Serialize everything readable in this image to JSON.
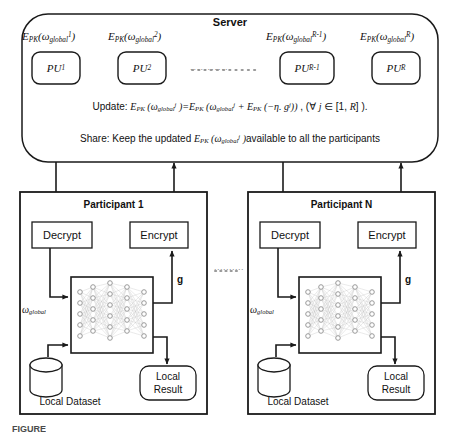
{
  "diagram": {
    "colors": {
      "stroke": "#1a1a1a",
      "background": "#ffffff",
      "network_node": "#9a9a9a",
      "network_edge": "#c8c8c8"
    }
  },
  "server": {
    "title": "Server",
    "pu_units": [
      {
        "id": "pu1",
        "label_base": "PU",
        "label_sub": "1",
        "cipher_base": "E",
        "cipher_sub": "PK",
        "omega_sub": "global",
        "omega_sup": "1"
      },
      {
        "id": "pu2",
        "label_base": "PU",
        "label_sub": "2",
        "cipher_base": "E",
        "cipher_sub": "PK",
        "omega_sub": "global",
        "omega_sup": "2"
      },
      {
        "id": "pur1",
        "label_base": "PU",
        "label_sub": "R-1",
        "cipher_base": "E",
        "cipher_sub": "PK",
        "omega_sub": "global",
        "omega_sup": "R-1"
      },
      {
        "id": "pur",
        "label_base": "PU",
        "label_sub": "R",
        "cipher_base": "E",
        "cipher_sub": "PK",
        "omega_sub": "global",
        "omega_sup": "R"
      }
    ],
    "ellipsis": "............",
    "update_line": "Update: E_PK (ω^j_global )=E_PK (ω^j_global  +  E_PK (−η. g^j)) , (∀ j  ∈ [1, R] ).",
    "share_line": "Share: Keep the updated E_PK (ω^j_global )available to all the participants"
  },
  "participants": [
    {
      "id": "participant-1",
      "title": "Participant 1",
      "decrypt_label": "Decrypt",
      "encrypt_label": "Encrypt",
      "gradient_label": "g",
      "weights_base": "ω",
      "weights_sub": "global",
      "dataset_label": "Local Dataset",
      "result_label_line1": "Local",
      "result_label_line2": "Result"
    },
    {
      "id": "participant-n",
      "title": "Participant N",
      "decrypt_label": "Decrypt",
      "encrypt_label": "Encrypt",
      "gradient_label": "g",
      "weights_base": "ω",
      "weights_sub": "global",
      "dataset_label": "Local Dataset",
      "result_label_line1": "Local",
      "result_label_line2": "Result"
    }
  ],
  "between_participants_ellipsis": "..........",
  "caption": {
    "figure_number": "FIGURE",
    "text": ""
  }
}
